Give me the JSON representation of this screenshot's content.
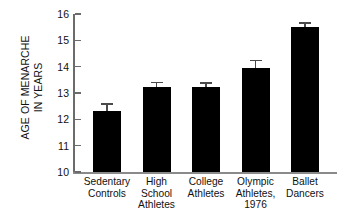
{
  "chart_data": {
    "type": "bar",
    "title": "",
    "xlabel": "",
    "ylabel": "AGE OF MENARCHE IN YEARS",
    "ylabel_lines": [
      "AGE OF MENARCHE",
      "IN YEARS"
    ],
    "ylim": [
      10,
      16
    ],
    "yticks": [
      10,
      11,
      12,
      13,
      14,
      15,
      16
    ],
    "ytick_labels": [
      "10",
      "11",
      "12",
      "13",
      "14",
      "15",
      "16"
    ],
    "grid": false,
    "legend": null,
    "bar_color": "#000000",
    "error_color": "#4a4a4a",
    "error_direction": "upper-only",
    "categories": [
      "Sedentary Controls",
      "High School Athletes",
      "College Athletes",
      "Olympic Athletes, 1976",
      "Ballet Dancers"
    ],
    "category_label_lines": [
      [
        "Sedentary",
        "Controls"
      ],
      [
        "High",
        "School",
        "Athletes"
      ],
      [
        "College",
        "Athletes"
      ],
      [
        "Olympic",
        "Athletes,",
        "1976"
      ],
      [
        "Ballet",
        "Dancers"
      ]
    ],
    "values": [
      12.32,
      13.23,
      13.23,
      13.95,
      15.5
    ],
    "errors": [
      0.25,
      0.17,
      0.14,
      0.28,
      0.17
    ],
    "series": [
      {
        "name": "Age of menarche",
        "values": [
          12.32,
          13.23,
          13.23,
          13.95,
          15.5
        ],
        "errors": [
          0.25,
          0.17,
          0.14,
          0.28,
          0.17
        ]
      }
    ]
  }
}
